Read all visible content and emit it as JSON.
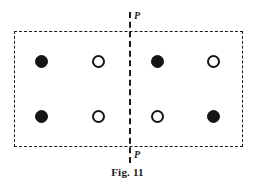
{
  "figure": {
    "caption": "Fig. 11",
    "background_color": "#ffffff",
    "line_color": "#1a1a1a",
    "width": 255,
    "height": 189
  },
  "unit_cell": {
    "shape": "rectangle",
    "style": "dashed",
    "x": 14,
    "y": 31,
    "width": 229,
    "height": 116
  },
  "symmetry_plane": {
    "label_top": "P",
    "label_bottom": "P",
    "orientation": "vertical",
    "style": "dashed",
    "x": 130,
    "y_top": 12,
    "y_bottom": 163
  },
  "legend": {
    "filled_label": "filled-circle",
    "open_label": "open-circle"
  },
  "atoms": [
    {
      "id": "atom-1",
      "row": "top",
      "column": 1,
      "type": "filled",
      "x": 41,
      "y": 61,
      "fill": "#151515"
    },
    {
      "id": "atom-2",
      "row": "top",
      "column": 2,
      "type": "open",
      "x": 98,
      "y": 61,
      "fill": "#ffffff"
    },
    {
      "id": "atom-3",
      "row": "top",
      "column": 3,
      "type": "filled",
      "x": 157,
      "y": 61,
      "fill": "#151515"
    },
    {
      "id": "atom-4",
      "row": "top",
      "column": 4,
      "type": "open",
      "x": 213,
      "y": 61,
      "fill": "#ffffff"
    },
    {
      "id": "atom-5",
      "row": "bottom",
      "column": 1,
      "type": "filled",
      "x": 41,
      "y": 116,
      "fill": "#151515"
    },
    {
      "id": "atom-6",
      "row": "bottom",
      "column": 2,
      "type": "open",
      "x": 98,
      "y": 116,
      "fill": "#ffffff"
    },
    {
      "id": "atom-7",
      "row": "bottom",
      "column": 3,
      "type": "open",
      "x": 157,
      "y": 116,
      "fill": "#ffffff"
    },
    {
      "id": "atom-8",
      "row": "bottom",
      "column": 4,
      "type": "filled",
      "x": 213,
      "y": 116,
      "fill": "#151515"
    }
  ]
}
